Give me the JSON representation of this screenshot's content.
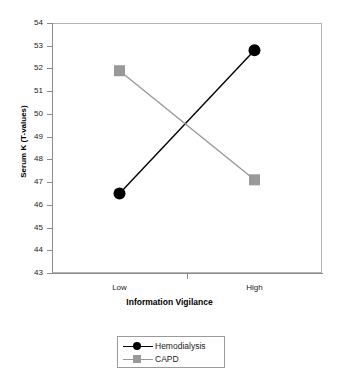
{
  "chart_data": {
    "type": "line",
    "title": "",
    "xlabel": "Information Vigilance",
    "ylabel": "Serum K (T-values)",
    "categories": [
      "Low",
      "High"
    ],
    "ylim": [
      43,
      54
    ],
    "yticks": [
      43,
      44,
      45,
      46,
      47,
      48,
      49,
      50,
      51,
      52,
      53,
      54
    ],
    "ytick_labels": [
      "43",
      "44",
      "45",
      "46",
      "47",
      "48",
      "49",
      "50",
      "51",
      "52",
      "53",
      "54"
    ],
    "grid": false,
    "legend_position": "below-center",
    "series": [
      {
        "name": "Hemodialysis",
        "values": [
          46.5,
          52.8
        ],
        "color": "#000000",
        "marker": "circle"
      },
      {
        "name": "CAPD",
        "values": [
          51.9,
          47.1
        ],
        "color": "#999999",
        "marker": "square"
      }
    ]
  },
  "axes": {
    "y_title": "Serum K (T-values)",
    "x_title": "Information Vigilance"
  },
  "legend": {
    "items": [
      {
        "label": "Hemodialysis",
        "color": "#000000",
        "marker": "circle"
      },
      {
        "label": "CAPD",
        "color": "#999999",
        "marker": "square"
      }
    ]
  },
  "colors": {
    "hemodialysis": "#000000",
    "capd": "#999999",
    "axis": "#8c8c8c",
    "frame": "#b4b4b4",
    "background": "#ffffff"
  }
}
